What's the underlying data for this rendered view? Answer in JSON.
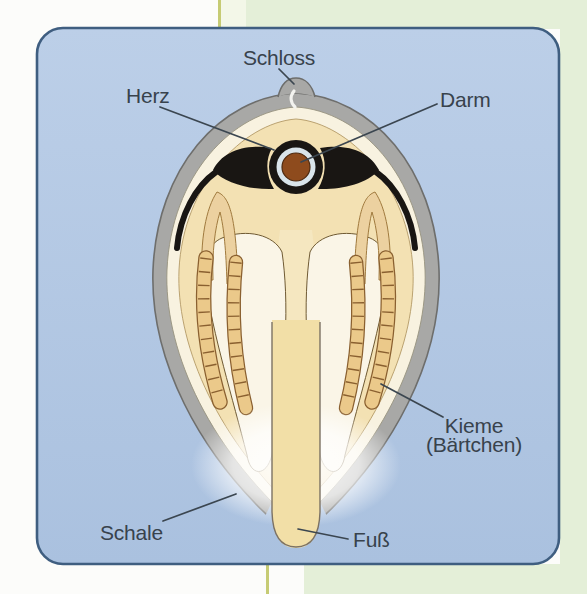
{
  "figure": {
    "labels": {
      "schloss": "Schloss",
      "herz": "Herz",
      "darm": "Darm",
      "kieme_line1": "Kieme",
      "kieme_line2": "(Bärtchen)",
      "schale": "Schale",
      "fuss": "Fuß"
    },
    "colors": {
      "page_background": "#fcfcfa",
      "page_green": "#e4efd8",
      "page_rule_line": "#c6cb74",
      "panel_blue_top": "#bccfe8",
      "panel_blue_bottom": "#aac1df",
      "panel_border": "#3f5e80",
      "shell_gray": "#a8a8a6",
      "shell_outline": "#6e6e6c",
      "inner_lining_ivory": "#f8f2e0",
      "body_cream": "#f3e1b3",
      "visceral_cream": "#f5e7c0",
      "foot_cream": "#f2dfa7",
      "gill_tan": "#ebc98a",
      "gill_outline": "#8a6030",
      "gonad_tan": "#ecd1a0",
      "mantle_white": "#faf5e7",
      "heart_black": "#191613",
      "pericard_pale": "#d9e4ea",
      "intestine_brown": "#8e4b1d",
      "label_text": "#38424c",
      "pointer_line": "#3b4650"
    }
  }
}
